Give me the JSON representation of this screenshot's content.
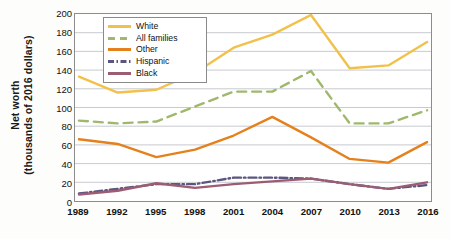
{
  "chart_data": {
    "type": "line",
    "title": "",
    "xlabel": "",
    "ylabel": "Net worth (thousands of 2016 dollars)",
    "ylabel_line1": "Net worth",
    "ylabel_line2": "(thousands of 2016 dollars)",
    "categories": [
      "1989",
      "1992",
      "1995",
      "1998",
      "2001",
      "2004",
      "2007",
      "2010",
      "2013",
      "2016"
    ],
    "x": [
      1989,
      1992,
      1995,
      1998,
      2001,
      2004,
      2007,
      2010,
      2013,
      2016
    ],
    "ylim": [
      0,
      200
    ],
    "yticks": [
      0,
      20,
      40,
      60,
      80,
      100,
      120,
      140,
      160,
      180,
      200
    ],
    "grid": "horizontal",
    "legend_position": "top-left-inside",
    "series": [
      {
        "name": "White",
        "color": "#F2C14B",
        "style": "solid",
        "values": [
          133,
          116,
          119,
          137,
          164,
          178,
          199,
          142,
          145,
          170
        ]
      },
      {
        "name": "All families",
        "color": "#9FB86B",
        "style": "dashed",
        "values": [
          86,
          83,
          85,
          101,
          117,
          117,
          139,
          83,
          83,
          97
        ]
      },
      {
        "name": "Other",
        "color": "#E5811C",
        "style": "solid",
        "values": [
          66,
          61,
          47,
          55,
          70,
          90,
          68,
          45,
          41,
          63
        ]
      },
      {
        "name": "Hispanic",
        "color": "#5B5580",
        "style": "dash-dot",
        "values": [
          8,
          13,
          18,
          18,
          25,
          25,
          24,
          18,
          13,
          17
        ]
      },
      {
        "name": "Black",
        "color": "#9C5D73",
        "style": "solid",
        "values": [
          7,
          11,
          19,
          14,
          18,
          21,
          24,
          18,
          13,
          20
        ]
      }
    ]
  }
}
